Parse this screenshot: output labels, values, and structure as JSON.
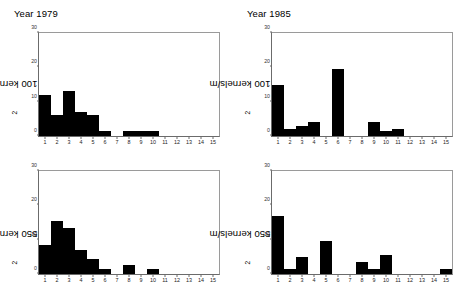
{
  "figure": {
    "panels": [
      {
        "id": "panel-1979-100",
        "title": "Year 1979",
        "ylabel_prefix": "100 kernels/m",
        "ylabel_sup": "2"
      },
      {
        "id": "panel-1985-100",
        "title": "Year 1985",
        "ylabel_prefix": "100 kernels/m",
        "ylabel_sup": "2"
      },
      {
        "id": "panel-1979-550",
        "title": "",
        "ylabel_prefix": "550 kernels/m",
        "ylabel_sup": "2"
      },
      {
        "id": "panel-1985-550",
        "title": "",
        "ylabel_prefix": "550 kernels/m",
        "ylabel_sup": "2"
      }
    ]
  },
  "axes": {
    "yticks": [
      0,
      10,
      20,
      30
    ],
    "ylim": [
      0,
      30
    ],
    "xticks": [
      1,
      2,
      3,
      4,
      5,
      6,
      7,
      8,
      9,
      10,
      11,
      12,
      13,
      14,
      15
    ],
    "xlim": [
      0.5,
      15.5
    ],
    "grid": false,
    "bar_color": "#000000",
    "axis_color": "#6b6b6b"
  },
  "chart_data": [
    {
      "type": "bar",
      "title": "Year 1979",
      "xlabel": "",
      "ylabel": "100 kernels/m2",
      "ylim": [
        0,
        30
      ],
      "xlim": [
        0.5,
        15.5
      ],
      "grid": false,
      "categories": [
        1,
        2,
        3,
        4,
        5,
        6,
        7,
        8,
        9,
        10,
        11,
        12,
        13,
        14,
        15
      ],
      "values": [
        12,
        6,
        13,
        7,
        6,
        1.5,
        0,
        1.5,
        1.5,
        1.5,
        0,
        0,
        0,
        0,
        0
      ]
    },
    {
      "type": "bar",
      "title": "Year 1985",
      "xlabel": "",
      "ylabel": "100 kernels/m2",
      "ylim": [
        0,
        30
      ],
      "xlim": [
        0.5,
        15.5
      ],
      "grid": false,
      "categories": [
        1,
        2,
        3,
        4,
        5,
        6,
        7,
        8,
        9,
        10,
        11,
        12,
        13,
        14,
        15
      ],
      "values": [
        15,
        2,
        3,
        4,
        0,
        19.5,
        0,
        0,
        4,
        1.5,
        2,
        0,
        0,
        0,
        0
      ]
    },
    {
      "type": "bar",
      "title": "",
      "xlabel": "",
      "ylabel": "550 kernels/m2",
      "ylim": [
        0,
        30
      ],
      "xlim": [
        0.5,
        15.5
      ],
      "grid": false,
      "categories": [
        1,
        2,
        3,
        4,
        5,
        6,
        7,
        8,
        9,
        10,
        11,
        12,
        13,
        14,
        15
      ],
      "values": [
        8.5,
        15.5,
        13.5,
        7,
        4.5,
        1.5,
        0,
        2.5,
        0,
        1.5,
        0,
        0,
        0,
        0,
        0
      ]
    },
    {
      "type": "bar",
      "title": "",
      "xlabel": "",
      "ylabel": "550 kernels/m2",
      "ylim": [
        0,
        30
      ],
      "xlim": [
        0.5,
        15.5
      ],
      "grid": false,
      "categories": [
        1,
        2,
        3,
        4,
        5,
        6,
        7,
        8,
        9,
        10,
        11,
        12,
        13,
        14,
        15
      ],
      "values": [
        17,
        1.5,
        5,
        0,
        9.5,
        0,
        0,
        3.5,
        1.5,
        5.5,
        0,
        0,
        0,
        0,
        1.5
      ]
    }
  ]
}
